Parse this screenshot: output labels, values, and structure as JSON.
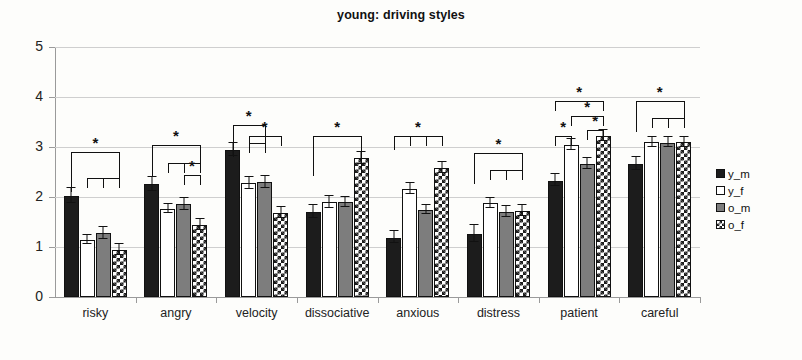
{
  "chart_data": {
    "type": "bar",
    "title": "young: driving styles",
    "xlabel": "",
    "ylabel": "",
    "ylim": [
      0,
      5
    ],
    "yticks": [
      "0",
      "1",
      "2",
      "3",
      "4",
      "5"
    ],
    "grid": true,
    "legend_position": "right",
    "categories": [
      "risky",
      "angry",
      "velocity",
      "dissociative",
      "anxious",
      "distress",
      "patient",
      "careful"
    ],
    "series": [
      {
        "name": "y_m",
        "fill": "solid-black",
        "color": "#1c1c1c",
        "values": [
          2.03,
          2.26,
          2.95,
          1.7,
          1.19,
          1.26,
          2.33,
          2.66
        ],
        "errors": [
          0.16,
          0.15,
          0.14,
          0.14,
          0.13,
          0.18,
          0.13,
          0.14
        ]
      },
      {
        "name": "y_f",
        "fill": "solid-white",
        "color": "#ffffff",
        "values": [
          1.15,
          1.76,
          2.28,
          1.9,
          2.16,
          1.88,
          3.05,
          3.1
        ],
        "errors": [
          0.1,
          0.1,
          0.13,
          0.13,
          0.12,
          0.11,
          0.12,
          0.11
        ]
      },
      {
        "name": "o_m",
        "fill": "solid-gray",
        "color": "#7d7d7d",
        "values": [
          1.28,
          1.86,
          2.3,
          1.9,
          1.74,
          1.7,
          2.67,
          3.09
        ],
        "errors": [
          0.13,
          0.13,
          0.13,
          0.11,
          0.1,
          0.12,
          0.12,
          0.11
        ]
      },
      {
        "name": "o_f",
        "fill": "checkerboard",
        "color": "#1c1c1c",
        "values": [
          0.95,
          1.45,
          1.69,
          2.78,
          2.58,
          1.72,
          3.22,
          3.1
        ],
        "errors": [
          0.12,
          0.12,
          0.12,
          0.13,
          0.12,
          0.12,
          0.12,
          0.11
        ]
      }
    ],
    "significance_marker": "*",
    "annotations": [
      {
        "category": "risky",
        "star": "*",
        "top": 2.9,
        "from": "y_m",
        "to": [
          "y_f",
          "o_m",
          "o_f"
        ],
        "sub_top": 2.38
      },
      {
        "category": "angry",
        "star": "*",
        "top": 3.05,
        "from": "y_m",
        "to": [
          "y_f",
          "o_m",
          "o_f"
        ],
        "sub_top": 2.68
      },
      {
        "category": "angry",
        "star": "*",
        "top": 2.44,
        "from": "o_m",
        "to": [
          "o_f"
        ]
      },
      {
        "category": "velocity",
        "star": "*",
        "top": 3.45,
        "from": "y_m",
        "to": [
          "y_f",
          "o_m"
        ],
        "sub_top": 3.08
      },
      {
        "category": "velocity",
        "star": "*",
        "top": 3.22,
        "from": "y_f",
        "to": [
          "o_f"
        ]
      },
      {
        "category": "dissociative",
        "star": "*",
        "top": 3.22,
        "from": "y_m",
        "to": [
          "o_f"
        ],
        "sub_top": 2.62
      },
      {
        "category": "anxious",
        "star": "*",
        "top": 3.22,
        "from": "y_m",
        "to": [
          "y_f",
          "o_m",
          "o_f"
        ]
      },
      {
        "category": "distress",
        "star": "*",
        "top": 2.88,
        "from": "y_m",
        "to": [
          "y_f",
          "o_m",
          "o_f"
        ],
        "sub_top": 2.54
      },
      {
        "category": "patient",
        "star": "*",
        "top": 3.92,
        "from": "y_m",
        "to": [
          "o_f"
        ]
      },
      {
        "category": "patient",
        "star": "*",
        "top": 3.62,
        "from": "y_f",
        "to": [
          "o_f"
        ]
      },
      {
        "category": "patient",
        "star": "*",
        "top": 3.34,
        "from": "o_m",
        "to": [
          "o_f"
        ]
      },
      {
        "category": "patient",
        "star": "*",
        "top": 3.22,
        "from": "y_m",
        "to": [
          "y_f"
        ]
      },
      {
        "category": "careful",
        "star": "*",
        "top": 3.92,
        "from": "y_m",
        "to": [
          "y_f",
          "o_m",
          "o_f"
        ],
        "sub_top": 3.58
      }
    ]
  },
  "legend": {
    "items": [
      {
        "label": "y_m",
        "swatch": "swatch-black"
      },
      {
        "label": "y_f",
        "swatch": "swatch-white"
      },
      {
        "label": "o_m",
        "swatch": "swatch-gray"
      },
      {
        "label": "o_f",
        "swatch": "swatch-checker"
      }
    ]
  }
}
